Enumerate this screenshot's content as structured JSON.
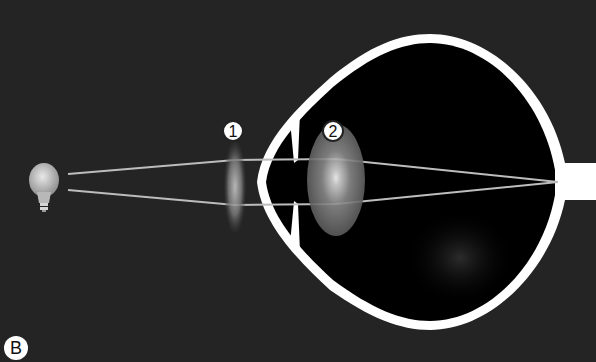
{
  "figure": {
    "panel_label": "B",
    "colors": {
      "background": "#242424",
      "eye_interior": "#000000",
      "sclera": "#ffffff",
      "ray": "#bfbfbf",
      "lens": "#a9a9a9"
    }
  },
  "labels": {
    "lens_external": "1",
    "lens_eye": "2"
  },
  "elements": {
    "light_source": "light-bulb",
    "external_lens": "corrective lens 1",
    "eye_lens": "crystalline lens 2",
    "focal_point": "retina / optic nerve"
  }
}
